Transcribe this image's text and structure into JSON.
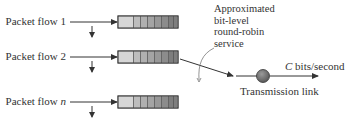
{
  "diagram": {
    "flows": [
      {
        "label_prefix": "Packet flow ",
        "label_id": "1",
        "id_italic": false
      },
      {
        "label_prefix": "Packet flow ",
        "label_id": "2",
        "id_italic": false
      },
      {
        "label_prefix": "Packet flow ",
        "label_id": "n",
        "id_italic": true
      }
    ],
    "annotation": {
      "line1": "Approximated",
      "line2": "bit-level",
      "line3": "round-robin",
      "line4": "service"
    },
    "output_rate": {
      "variable": "C",
      "unit": " bits/second"
    },
    "link_label": "Transmission link",
    "colors": {
      "line": "#333333",
      "queue_border": "#444444",
      "queue_cells": [
        "#d6d6d6",
        "#bdbdbd",
        "#b0b0b0",
        "#a4a4a4",
        "#989898",
        "#8c8c8c",
        "#7e7e7e"
      ],
      "link_circle": "#6e6e6e"
    }
  }
}
